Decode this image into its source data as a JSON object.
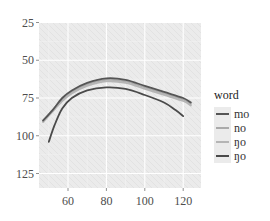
{
  "chart_data": {
    "type": "line",
    "title": "",
    "xlabel": "",
    "ylabel": "",
    "xlim": [
      44,
      126
    ],
    "ylim": [
      128,
      23
    ],
    "y_reversed": true,
    "grid": true,
    "x_ticks": [
      60,
      80,
      100,
      120
    ],
    "y_ticks": [
      25,
      50,
      75,
      100,
      125
    ],
    "legend": {
      "title": "word",
      "position": "right"
    },
    "series": [
      {
        "name": "mo",
        "color": "#555555",
        "x": [
          47,
          52,
          57,
          62,
          70,
          80,
          90,
          100,
          110,
          120,
          124
        ],
        "y": [
          90,
          83,
          75,
          70,
          65,
          62,
          63,
          67,
          71,
          75,
          78
        ]
      },
      {
        "name": "no",
        "color": "#aaaaaa",
        "x": [
          47,
          52,
          57,
          62,
          70,
          80,
          90,
          100,
          110,
          120,
          124
        ],
        "y": [
          90,
          83,
          76,
          71,
          66,
          63,
          64,
          68,
          72,
          76,
          79
        ]
      },
      {
        "name": "ŋo",
        "color": "#b5b5b5",
        "x": [
          47,
          52,
          57,
          62,
          70,
          80,
          90,
          100,
          110,
          120,
          124
        ],
        "y": [
          91,
          84,
          77,
          72,
          67,
          64,
          65,
          69,
          73,
          77,
          80
        ]
      },
      {
        "name": "ŋo",
        "color": "#4a4a4a",
        "x": [
          50,
          53,
          57,
          62,
          70,
          80,
          90,
          100,
          110,
          116,
          120
        ],
        "y": [
          104,
          93,
          82,
          75,
          70,
          68,
          69,
          73,
          78,
          83,
          87
        ]
      }
    ]
  },
  "axis": {
    "y_labels": [
      "25",
      "50",
      "75",
      "100",
      "125"
    ],
    "x_labels": [
      "60",
      "80",
      "100",
      "120"
    ]
  },
  "legend": {
    "title": "word",
    "items": [
      {
        "label": "mo",
        "color": "#555555"
      },
      {
        "label": "no",
        "color": "#aaaaaa"
      },
      {
        "label": "ŋo",
        "color": "#b5b5b5"
      },
      {
        "label": "ŋo",
        "color": "#4a4a4a"
      }
    ]
  }
}
